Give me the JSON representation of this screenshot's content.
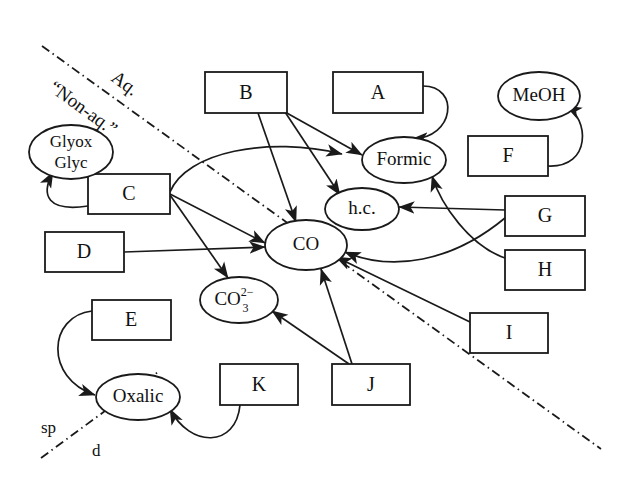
{
  "diagram": {
    "background_color": "#ffffff",
    "line_color": "#1a1a1a",
    "phase_divider": {
      "style": "dash-dot",
      "upper_label": "Aq.",
      "lower_label": "“Non-aq.”",
      "corner_label_left": "sp",
      "corner_label_right": "d"
    },
    "boxes": [
      {
        "id": "A",
        "label": "A",
        "x": 333,
        "y": 72,
        "w": 90,
        "h": 41
      },
      {
        "id": "B",
        "label": "B",
        "x": 205,
        "y": 72,
        "w": 82,
        "h": 41
      },
      {
        "id": "C",
        "label": "C",
        "x": 88,
        "y": 174,
        "w": 82,
        "h": 40
      },
      {
        "id": "D",
        "label": "D",
        "x": 45,
        "y": 232,
        "w": 79,
        "h": 40
      },
      {
        "id": "E",
        "label": "E",
        "x": 92,
        "y": 300,
        "w": 79,
        "h": 40
      },
      {
        "id": "F",
        "label": "F",
        "x": 468,
        "y": 136,
        "w": 80,
        "h": 40
      },
      {
        "id": "G",
        "label": "G",
        "x": 505,
        "y": 196,
        "w": 80,
        "h": 40
      },
      {
        "id": "H",
        "label": "H",
        "x": 505,
        "y": 250,
        "w": 80,
        "h": 40
      },
      {
        "id": "I",
        "label": "I",
        "x": 470,
        "y": 313,
        "w": 78,
        "h": 40
      },
      {
        "id": "J",
        "label": "J",
        "x": 332,
        "y": 364,
        "w": 78,
        "h": 41
      },
      {
        "id": "K",
        "label": "K",
        "x": 220,
        "y": 364,
        "w": 78,
        "h": 41
      }
    ],
    "ellipses": [
      {
        "id": "glyox",
        "label_line1": "Glyox",
        "label_line2": "Glyc",
        "cx": 71,
        "cy": 152,
        "rx": 42,
        "ry": 27
      },
      {
        "id": "meoh",
        "label": "MeOH",
        "cx": 539,
        "cy": 96,
        "rx": 41,
        "ry": 24
      },
      {
        "id": "formic",
        "label": "Formic",
        "cx": 404,
        "cy": 160,
        "rx": 42,
        "ry": 23
      },
      {
        "id": "hc",
        "label": "h.c.",
        "cx": 362,
        "cy": 209,
        "rx": 37,
        "ry": 21
      },
      {
        "id": "co",
        "label": "CO",
        "cx": 306,
        "cy": 245,
        "rx": 41,
        "ry": 25
      },
      {
        "id": "co3",
        "label": "CO",
        "sub": "3",
        "sup": "2−",
        "cx": 239,
        "cy": 300,
        "rx": 39,
        "ry": 23
      },
      {
        "id": "oxalic",
        "label": "Oxalic",
        "cx": 138,
        "cy": 397,
        "rx": 42,
        "ry": 23
      }
    ],
    "edges": [
      {
        "from": "B",
        "to": "formic",
        "kind": "arrow"
      },
      {
        "from": "B",
        "to": "hc",
        "kind": "arrow"
      },
      {
        "from": "B",
        "to": "co",
        "kind": "arrow"
      },
      {
        "from": "A",
        "to": "formic",
        "kind": "curved-arrow"
      },
      {
        "from": "F",
        "to": "meoh",
        "kind": "curved-arrow"
      },
      {
        "from": "G",
        "to": "hc",
        "kind": "arrow"
      },
      {
        "from": "G",
        "to": "co",
        "kind": "curved-arrow"
      },
      {
        "from": "H",
        "to": "formic",
        "kind": "curved-arrow"
      },
      {
        "from": "I",
        "to": "co",
        "kind": "arrow"
      },
      {
        "from": "J",
        "to": "co",
        "kind": "arrow"
      },
      {
        "from": "J",
        "to": "co3",
        "kind": "arrow"
      },
      {
        "from": "C",
        "to": "glyox",
        "kind": "curved-arrow"
      },
      {
        "from": "C",
        "to": "co",
        "kind": "arrow"
      },
      {
        "from": "C",
        "to": "co3",
        "kind": "arrow"
      },
      {
        "from": "C",
        "to": "formic",
        "kind": "curved-arrow"
      },
      {
        "from": "D",
        "to": "co",
        "kind": "arrow"
      },
      {
        "from": "E",
        "to": "oxalic",
        "kind": "curved-arrow"
      },
      {
        "from": "K",
        "to": "oxalic",
        "kind": "curved-arrow"
      }
    ]
  }
}
